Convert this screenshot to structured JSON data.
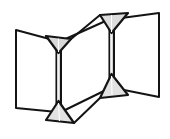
{
  "figure": {
    "type": "line-drawing",
    "canvas": {
      "width": 170,
      "height": 139
    },
    "colors": {
      "background": "#ffffff",
      "stroke": "#141414",
      "panel_fill": "#ffffff",
      "hinge_fill": "#d8d8d8",
      "hinge_fill_light": "#eaeaea",
      "spine_fill": "#f2f2f2"
    },
    "stroke_widths": {
      "panel_outline": 2.0,
      "hinge_outline": 2.2,
      "spine": 1.6,
      "crease": 0.9
    },
    "parts": [
      {
        "name": "left-panel",
        "shape": "quadrilateral",
        "points": "16,30 57,41 57,112 16,108",
        "fill": "#ffffff"
      },
      {
        "name": "middle-panel",
        "shape": "quadrilateral",
        "points": "61,41 110,19 110,88 61,112",
        "fill": "#ffffff"
      },
      {
        "name": "right-panel",
        "shape": "quadrilateral",
        "points": "114,19 159,13 159,97 114,88",
        "fill": "#ffffff"
      }
    ],
    "spines": [
      {
        "name": "left-spine",
        "x_left": 56.0,
        "x_right": 61.0,
        "y_top": 48.0,
        "y_bottom": 106.0
      },
      {
        "name": "right-spine",
        "x_left": 109.0,
        "x_right": 114.0,
        "y_top": 27.0,
        "y_bottom": 80.0
      }
    ],
    "hinges": [
      {
        "name": "hinge-upper-left",
        "orientation": "apex-down",
        "points": "46,36 71,39 58.5,53",
        "fill": "#d8d8d8"
      },
      {
        "name": "hinge-lower-left",
        "orientation": "apex-up",
        "points": "58.5,101 74,123 46,120",
        "fill": "#e2e2e2"
      },
      {
        "name": "hinge-upper-right",
        "orientation": "apex-down",
        "points": "100,15 128,13 111.5,33",
        "fill": "#dcdcdc"
      },
      {
        "name": "hinge-lower-right",
        "orientation": "apex-up",
        "points": "111.5,74 128,95 100,98",
        "fill": "#e2e2e2"
      }
    ],
    "connectors": [
      {
        "name": "upper-connector",
        "from": "hinge-upper-left",
        "to": "hinge-upper-right",
        "x1": 71,
        "y1": 39,
        "x2": 100,
        "y2": 15
      },
      {
        "name": "lower-connector",
        "from": "hinge-lower-right",
        "to": "hinge-lower-left",
        "x1": 100,
        "y1": 98,
        "x2": 74,
        "y2": 123
      }
    ],
    "creases": [
      {
        "name": "crease-upper-left",
        "x1": 58.5,
        "y1": 38.5,
        "x2": 58.5,
        "y2": 52
      },
      {
        "name": "crease-lower-left",
        "x1": 58.5,
        "y1": 102,
        "x2": 58.5,
        "y2": 121
      },
      {
        "name": "crease-upper-right",
        "x1": 111.5,
        "y1": 14,
        "x2": 111.5,
        "y2": 32
      },
      {
        "name": "crease-lower-right",
        "x1": 111.5,
        "y1": 75,
        "x2": 111.5,
        "y2": 96
      }
    ]
  }
}
